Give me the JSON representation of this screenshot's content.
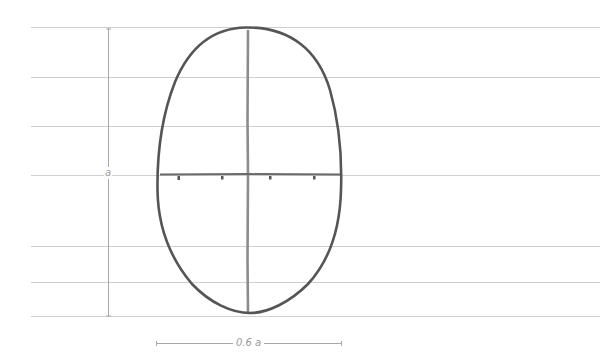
{
  "diagram": {
    "labels": {
      "height": "a",
      "width": "0.6 a"
    },
    "guide_lines_y": [
      27,
      77,
      126,
      175,
      246,
      282,
      316
    ],
    "colors": {
      "guide": "#c8c8c8",
      "outline": "#5a5a5a",
      "axis": "#8a8a8a",
      "dimension": "#9a9a9a",
      "background": "#ffffff"
    },
    "oval": {
      "top": 27,
      "bottom": 313,
      "left": 157,
      "right": 341,
      "center_x": 248,
      "widest_y": 175
    },
    "tick_marks_x": [
      179,
      222,
      270,
      314
    ]
  }
}
